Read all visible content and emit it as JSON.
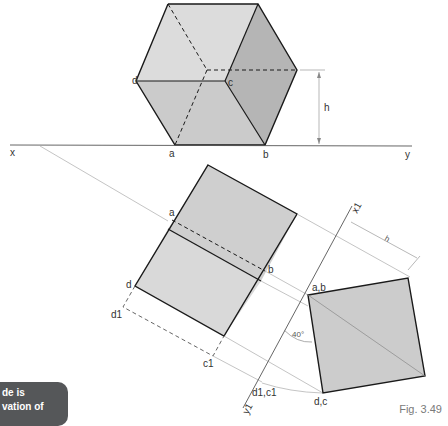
{
  "figure": {
    "caption": "Fig. 3.49",
    "labels": {
      "x": "x",
      "y": "y",
      "x1": "x1",
      "y1": "y1",
      "a": "a",
      "b": "b",
      "c": "c",
      "d": "d",
      "h": "h",
      "d1": "d1",
      "c1": "c1",
      "ab": "a,b",
      "dc": "d,c",
      "d1c1": "d1,c1",
      "angle": "40°"
    },
    "colors": {
      "face_light": "#d9d9d9",
      "face_mid": "#c8c8c8",
      "face_dark": "#b3b3b3",
      "edge": "#1a1a1a",
      "construction": "#9a9a9a"
    }
  },
  "badge": {
    "line1": "de is",
    "line2": "vation of"
  }
}
